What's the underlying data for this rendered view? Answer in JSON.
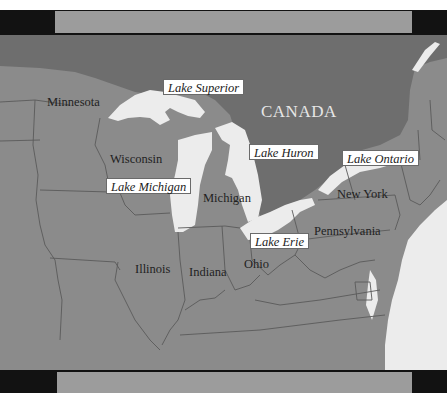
{
  "colors": {
    "frame": "#121212",
    "frame_inner": "#9c9c9c",
    "us_states": "#8b8b8b",
    "canada": "#6e6e6e",
    "water": "#ececec",
    "border_line": "#5a5a5a"
  },
  "country": {
    "label": "CANADA"
  },
  "states": [
    {
      "id": "minnesota",
      "label": "Minnesota"
    },
    {
      "id": "wisconsin",
      "label": "Wisconsin"
    },
    {
      "id": "michigan",
      "label": "Michigan"
    },
    {
      "id": "illinois",
      "label": "Illinois"
    },
    {
      "id": "indiana",
      "label": "Indiana"
    },
    {
      "id": "ohio",
      "label": "Ohio"
    },
    {
      "id": "pennsylvania",
      "label": "Pennsylvania"
    },
    {
      "id": "new-york",
      "label": "New York"
    }
  ],
  "lakes": [
    {
      "id": "superior",
      "label": "Lake Superior"
    },
    {
      "id": "michigan",
      "label": "Lake Michigan"
    },
    {
      "id": "huron",
      "label": "Lake Huron"
    },
    {
      "id": "ontario",
      "label": "Lake Ontario"
    },
    {
      "id": "erie",
      "label": "Lake Erie"
    }
  ]
}
